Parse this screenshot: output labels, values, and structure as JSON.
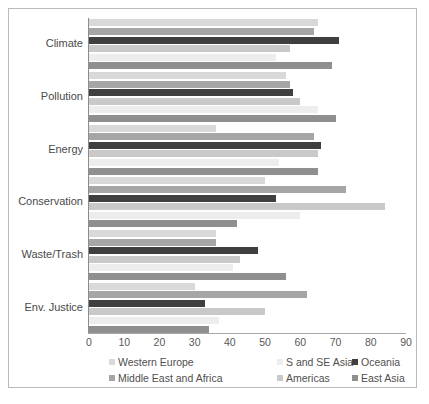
{
  "chart_data": {
    "type": "bar",
    "orientation": "horizontal",
    "title": "",
    "xlabel": "",
    "ylabel": "",
    "xlim": [
      0,
      90
    ],
    "xticks": [
      0,
      10,
      20,
      30,
      40,
      50,
      60,
      70,
      80,
      90
    ],
    "grid": false,
    "legend_position": "bottom",
    "categories": [
      "Climate",
      "Pollution",
      "Energy",
      "Conservation",
      "Waste/Trash",
      "Env. Justice"
    ],
    "series": [
      {
        "name": "Western Europe",
        "color": "#d9d9d9",
        "values": [
          65,
          56,
          36,
          50,
          36,
          30
        ]
      },
      {
        "name": "Middle East and Africa",
        "color": "#a6a6a6",
        "values": [
          64,
          57,
          64,
          73,
          36,
          62
        ]
      },
      {
        "name": "S and SE Asia",
        "color": "#ededed",
        "values": [
          53,
          65,
          54,
          60,
          41,
          37
        ]
      },
      {
        "name": "Americas",
        "color": "#c9c9c9",
        "values": [
          57,
          60,
          65,
          84,
          43,
          50
        ]
      },
      {
        "name": "Oceania",
        "color": "#3f3f3f",
        "values": [
          71,
          58,
          66,
          53,
          48,
          33
        ]
      },
      {
        "name": "East Asia",
        "color": "#8f8f8f",
        "values": [
          69,
          70,
          65,
          42,
          56,
          34
        ]
      }
    ],
    "series_draw_order": [
      "Western Europe",
      "Middle East and Africa",
      "Oceania",
      "Americas",
      "S and SE Asia",
      "East Asia"
    ]
  },
  "legend": {
    "row1": [
      {
        "label": "Western Europe",
        "color": "#d9d9d9"
      },
      {
        "label": "S and SE Asia",
        "color": "#ededed"
      },
      {
        "label": "Oceania",
        "color": "#3f3f3f"
      }
    ],
    "row2": [
      {
        "label": "Middle East and Africa",
        "color": "#a6a6a6"
      },
      {
        "label": "Americas",
        "color": "#c9c9c9"
      },
      {
        "label": "East Asia",
        "color": "#8f8f8f"
      }
    ]
  }
}
